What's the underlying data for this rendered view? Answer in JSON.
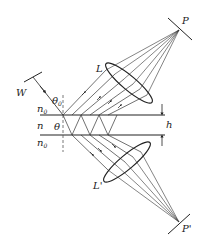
{
  "diagram": {
    "title": "",
    "labels": {
      "P": "P",
      "P_prime": "P'",
      "L": "L",
      "L_prime": "L'",
      "W": "W",
      "n0_top": "n",
      "n0_top_sub": "0",
      "n": "n",
      "n0_bottom": "n",
      "n0_bottom_sub": "0",
      "theta0": "θ",
      "theta0_sub": "0",
      "theta": "θ",
      "h": "h"
    },
    "colors": {
      "line": "#222222",
      "thin_line": "#444444",
      "background": "#ffffff"
    }
  }
}
